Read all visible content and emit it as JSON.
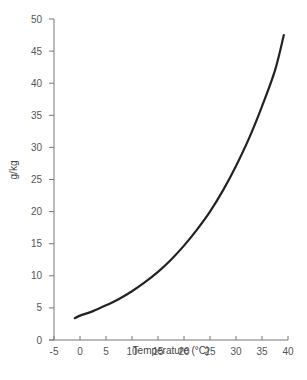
{
  "chart_data": {
    "type": "line",
    "title": "",
    "xlabel": "Temperature (°C)",
    "ylabel": "g/kg",
    "xlim": [
      -5,
      40
    ],
    "ylim": [
      0,
      50
    ],
    "x_ticks": [
      -5,
      0,
      5,
      10,
      15,
      20,
      25,
      30,
      35,
      40
    ],
    "y_ticks": [
      0,
      5,
      10,
      15,
      20,
      25,
      30,
      35,
      40,
      45,
      50
    ],
    "grid": false,
    "legend": null,
    "series": [
      {
        "name": "saturation specific humidity",
        "color": "#222222",
        "x": [
          -1,
          0,
          2.5,
          5,
          7.5,
          10,
          12.5,
          15,
          17.5,
          20,
          22.5,
          25,
          27.5,
          30,
          32.5,
          35,
          37.5,
          39.2
        ],
        "y": [
          3.4,
          3.8,
          4.5,
          5.4,
          6.4,
          7.6,
          9.0,
          10.6,
          12.5,
          14.7,
          17.2,
          20.0,
          23.3,
          27.1,
          31.4,
          36.4,
          42.0,
          47.5
        ]
      }
    ]
  },
  "axes": {
    "color": "#777777"
  }
}
